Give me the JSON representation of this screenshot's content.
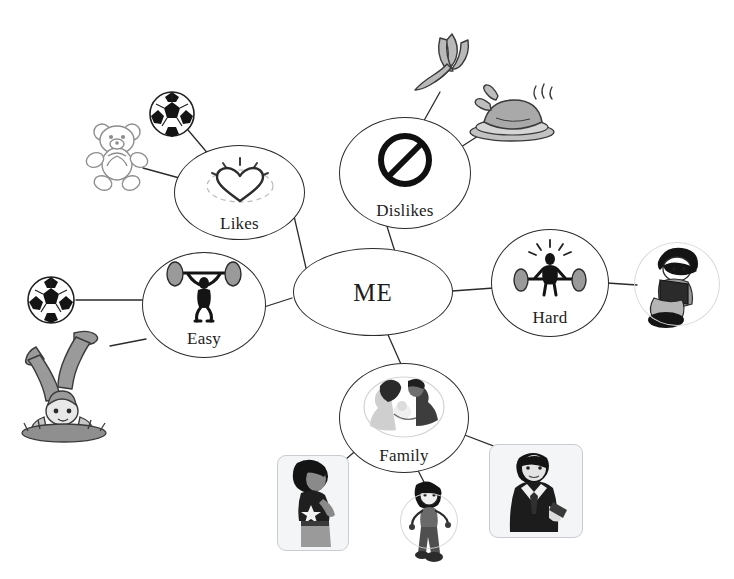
{
  "diagram": {
    "title_node": "ME",
    "type": "mind-map",
    "background_color": "#ffffff",
    "line_color": "#2b2b2b",
    "text_color": "#1c1c1c"
  },
  "hub": {
    "label": "ME",
    "icon": "none"
  },
  "branches": [
    {
      "id": "likes",
      "label": "Likes",
      "icon": "shining-heart-icon",
      "leaves": [
        {
          "id": "teddy-bear",
          "icon": "teddy-bear-icon",
          "style": "line-art"
        },
        {
          "id": "soccer-ball-likes",
          "icon": "soccer-ball-icon",
          "style": "photo"
        }
      ]
    },
    {
      "id": "dislikes",
      "label": "Dislikes",
      "icon": "prohibition-sign-icon",
      "leaves": [
        {
          "id": "banana",
          "icon": "peeled-banana-icon",
          "style": "illustration"
        },
        {
          "id": "roast-chicken",
          "icon": "roast-chicken-icon",
          "style": "illustration"
        }
      ]
    },
    {
      "id": "hard",
      "label": "Hard",
      "icon": "struggling-weightlifter-icon",
      "leaves": [
        {
          "id": "child-reading",
          "icon": "child-reading-book-icon",
          "style": "circle-frame"
        }
      ]
    },
    {
      "id": "easy",
      "label": "Easy",
      "icon": "lifting-weightlifter-icon",
      "leaves": [
        {
          "id": "soccer-ball-easy",
          "icon": "soccer-ball-icon",
          "style": "photo"
        },
        {
          "id": "handstand-child",
          "icon": "handstand-child-icon",
          "style": "illustration"
        }
      ]
    },
    {
      "id": "family",
      "label": "Family",
      "icon": "couple-with-baby-icon",
      "leaves": [
        {
          "id": "mother-photo",
          "icon": "woman-star-shirt-icon",
          "style": "photo-frame"
        },
        {
          "id": "girl-figure",
          "icon": "girl-standing-icon",
          "style": "circle-frame"
        },
        {
          "id": "father-photo",
          "icon": "man-in-suit-icon",
          "style": "photo-frame"
        }
      ]
    }
  ]
}
